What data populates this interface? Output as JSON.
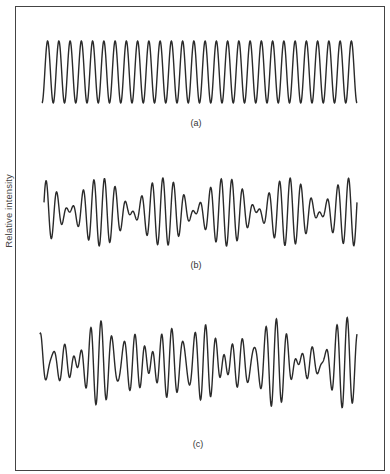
{
  "chart_data": {
    "type": "line",
    "title": "",
    "ylabel": "Relative intensity",
    "xlabel": "",
    "grid": false,
    "legend": null,
    "panels": [
      {
        "label": "(a)",
        "description": "Single pure sinusoid of constant amplitude",
        "x_range": [
          42,
          357
        ],
        "center_y": 72,
        "cycles": 28,
        "components": [
          {
            "freq": 28,
            "amp": 31,
            "phase": -1.57
          }
        ]
      },
      {
        "label": "(b)",
        "description": "Beating waveform from two close frequencies (amplitude envelope with ~5 lobes)",
        "x_range": [
          44,
          357
        ],
        "center_y": 212,
        "components": [
          {
            "freq": 27,
            "amp": 17,
            "phase": 0
          },
          {
            "freq": 32,
            "amp": 17,
            "phase": 0.6
          }
        ]
      },
      {
        "label": "(c)",
        "description": "Irregular waveform from superposition of several frequencies",
        "x_range": [
          40,
          357
        ],
        "center_y": 363,
        "components": [
          {
            "freq": 27,
            "amp": 18,
            "phase": 0.4
          },
          {
            "freq": 31,
            "amp": 15,
            "phase": 1.2
          },
          {
            "freq": 36,
            "amp": 13,
            "phase": 2.5
          }
        ]
      }
    ]
  },
  "labels": {
    "y_axis": "Relative intensity",
    "panel_a": "(a)",
    "panel_b": "(b)",
    "panel_c": "(c)"
  }
}
